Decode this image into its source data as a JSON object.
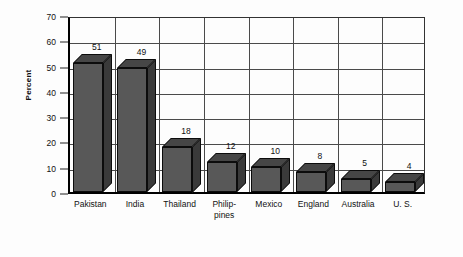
{
  "chart_data": {
    "type": "bar",
    "title": "",
    "subtitle": "",
    "xlabel": "",
    "ylabel": "Percent",
    "ylim": [
      0,
      70
    ],
    "yticks": [
      0,
      10,
      20,
      30,
      40,
      50,
      60,
      70
    ],
    "ytick_labels": [
      "0",
      "10",
      "20",
      "30",
      "40",
      "50",
      "60",
      "70"
    ],
    "grid": "both",
    "legend": "none",
    "style": "3d-bars",
    "categories": [
      "Pakistan",
      "India",
      "Thailand",
      "Philip-\npines",
      "Mexico",
      "England",
      "Australia",
      "U. S."
    ],
    "category_labels_flat": [
      "Pakistan",
      "India",
      "Thailand",
      "Philippines",
      "Mexico",
      "England",
      "Australia",
      "U. S."
    ],
    "values": [
      51,
      49,
      18,
      12,
      10,
      8,
      5,
      4
    ],
    "value_labels": [
      "51",
      "49",
      "18",
      "12",
      "10",
      "8",
      "5",
      "4"
    ],
    "bar_face_color": "#585858",
    "bar_top_color": "#464646",
    "bar_side_color": "#3a3a3a",
    "bar_edge_color": "#0c0c0c",
    "grid_color": "#4a4a4a",
    "axis_color": "#000000",
    "background_color": "#fdfdfd",
    "text_color": "#111111"
  }
}
